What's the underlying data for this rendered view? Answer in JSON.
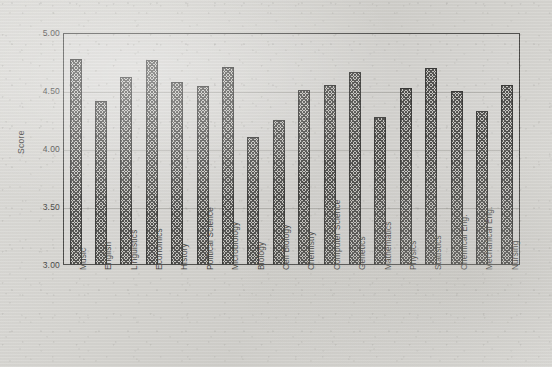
{
  "chart_data": {
    "type": "bar",
    "title": "",
    "subtitle": "",
    "xlabel": "",
    "ylabel": "Score",
    "ylim": [
      3.0,
      5.0
    ],
    "yticks": [
      "3.00",
      "3.50",
      "4.00",
      "4.50",
      "5.00"
    ],
    "ytick_values": [
      3.0,
      3.5,
      4.0,
      4.5,
      5.0
    ],
    "grid": true,
    "legend": false,
    "legend_position": "none",
    "categories": [
      "Music",
      "English",
      "Linguistics",
      "Economics",
      "History",
      "Political Science",
      "Microbiology",
      "Biology",
      "Cell Biology",
      "Chemistry",
      "Computer Science",
      "Genetics",
      "Mathematics",
      "Physics",
      "Statistics",
      "Chemical Eng.",
      "Mechanical Eng.",
      "Nursing"
    ],
    "values": [
      4.78,
      4.41,
      4.62,
      4.77,
      4.58,
      4.54,
      4.71,
      4.1,
      4.25,
      4.51,
      4.55,
      4.66,
      4.28,
      4.53,
      4.7,
      4.5,
      4.33,
      4.55
    ],
    "bar_color": "#3a3a38",
    "bar_fill_pattern": "crosshatch",
    "bar_edge_color": "#1f1f1e",
    "background_color": "#d8d7d3"
  }
}
